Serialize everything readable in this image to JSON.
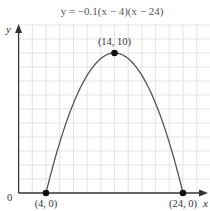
{
  "chart_data": {
    "type": "line",
    "title": "y = −0.1(x − 4)(x − 24)",
    "equation": "y = -0.1(x - 4)(x - 24)",
    "xlabel": "x",
    "ylabel": "y",
    "origin_label": "0",
    "xlim": [
      0,
      28
    ],
    "ylim": [
      0,
      12
    ],
    "grid": true,
    "grid_step_x": 2,
    "grid_step_y": 1,
    "series": [
      {
        "name": "y = -0.1(x - 4)(x - 24)",
        "function": "-0.1*(x-4)*(x-24)",
        "x_range": [
          4,
          24
        ],
        "color": "#555555"
      }
    ],
    "points": [
      {
        "x": 4,
        "y": 0,
        "label": "(4, 0)"
      },
      {
        "x": 14,
        "y": 10,
        "label": "(14, 10)"
      },
      {
        "x": 24,
        "y": 0,
        "label": "(24, 0)"
      }
    ]
  },
  "colors": {
    "grid": "#dcdcdc",
    "axis": "#333333",
    "curve": "#555555",
    "point": "#111111"
  }
}
